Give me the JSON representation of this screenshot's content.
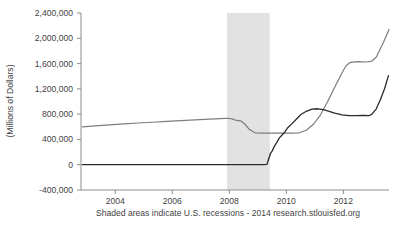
{
  "chart_data": {
    "type": "line",
    "title": "",
    "xlabel": "",
    "ylabel": "(Millions of  Dollars)",
    "caption": "Shaded areas indicate U.S.  recessions - 2014 research.stlouisfed.org",
    "grid": false,
    "legend": "none",
    "xlim": [
      2002.8,
      2013.6
    ],
    "ylim": [
      -400000,
      2400000
    ],
    "x_ticks": [
      "2004",
      "2006",
      "2008",
      "2012"
    ],
    "x_tick_labels": [
      "2004",
      "2006",
      "2008",
      "2010",
      "2012"
    ],
    "x_tick_values": [
      2004,
      2006,
      2008,
      2010,
      2012
    ],
    "y_tick_labels": [
      "2,400,000",
      "2,000,000",
      "1,600,000",
      "1,200,000",
      "800,000",
      "400,000",
      "0",
      "-400,000"
    ],
    "y_tick_values": [
      2400000,
      2000000,
      1600000,
      1200000,
      800000,
      400000,
      0,
      -400000
    ],
    "zero_line_value": 0,
    "shaded_regions": [
      {
        "label": "U.S. recession",
        "start": 2007.92,
        "end": 2009.42,
        "color": "#e2e2e2"
      }
    ],
    "series": [
      {
        "name": "series-gray",
        "color": "#7d7d7d",
        "points": [
          [
            2002.85,
            600000
          ],
          [
            2003.3,
            615000
          ],
          [
            2003.8,
            630000
          ],
          [
            2004.3,
            645000
          ],
          [
            2004.8,
            660000
          ],
          [
            2005.3,
            672000
          ],
          [
            2005.8,
            685000
          ],
          [
            2006.3,
            697000
          ],
          [
            2006.8,
            708000
          ],
          [
            2007.3,
            720000
          ],
          [
            2007.7,
            730000
          ],
          [
            2007.95,
            735000
          ],
          [
            2008.1,
            725000
          ],
          [
            2008.25,
            700000
          ],
          [
            2008.4,
            695000
          ],
          [
            2008.55,
            640000
          ],
          [
            2008.7,
            560000
          ],
          [
            2008.9,
            505000
          ],
          [
            2009.1,
            500000
          ],
          [
            2009.4,
            500000
          ],
          [
            2009.7,
            500000
          ],
          [
            2009.95,
            500000
          ],
          [
            2010.2,
            500000
          ],
          [
            2010.45,
            505000
          ],
          [
            2010.7,
            545000
          ],
          [
            2010.95,
            640000
          ],
          [
            2011.2,
            790000
          ],
          [
            2011.45,
            1000000
          ],
          [
            2011.7,
            1230000
          ],
          [
            2011.95,
            1450000
          ],
          [
            2012.1,
            1570000
          ],
          [
            2012.25,
            1620000
          ],
          [
            2012.5,
            1630000
          ],
          [
            2012.8,
            1625000
          ],
          [
            2013.0,
            1640000
          ],
          [
            2013.15,
            1700000
          ],
          [
            2013.4,
            1930000
          ],
          [
            2013.6,
            2140000
          ]
        ]
      },
      {
        "name": "series-black",
        "color": "#2b2b2b",
        "points": [
          [
            2002.85,
            0
          ],
          [
            2004.0,
            0
          ],
          [
            2006.0,
            0
          ],
          [
            2007.5,
            0
          ],
          [
            2008.0,
            0
          ],
          [
            2008.6,
            0
          ],
          [
            2009.0,
            0
          ],
          [
            2009.2,
            0
          ],
          [
            2009.32,
            5000
          ],
          [
            2009.38,
            90000
          ],
          [
            2009.45,
            185000
          ],
          [
            2009.5,
            215000
          ],
          [
            2009.58,
            290000
          ],
          [
            2009.65,
            340000
          ],
          [
            2009.75,
            420000
          ],
          [
            2009.85,
            470000
          ],
          [
            2009.95,
            520000
          ],
          [
            2010.05,
            585000
          ],
          [
            2010.2,
            650000
          ],
          [
            2010.35,
            720000
          ],
          [
            2010.5,
            790000
          ],
          [
            2010.7,
            845000
          ],
          [
            2010.9,
            880000
          ],
          [
            2011.1,
            885000
          ],
          [
            2011.3,
            870000
          ],
          [
            2011.5,
            845000
          ],
          [
            2011.7,
            815000
          ],
          [
            2011.95,
            790000
          ],
          [
            2012.2,
            775000
          ],
          [
            2012.45,
            775000
          ],
          [
            2012.7,
            780000
          ],
          [
            2012.9,
            775000
          ],
          [
            2013.0,
            800000
          ],
          [
            2013.15,
            880000
          ],
          [
            2013.3,
            1030000
          ],
          [
            2013.45,
            1210000
          ],
          [
            2013.58,
            1410000
          ]
        ]
      }
    ]
  },
  "axes": {
    "plot_left": 81,
    "plot_right": 389,
    "plot_top": 13,
    "plot_bottom": 190
  }
}
